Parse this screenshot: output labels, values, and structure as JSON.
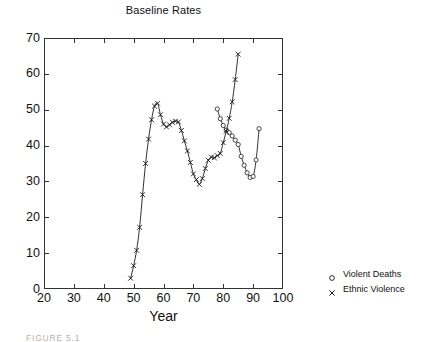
{
  "chart_data": {
    "type": "line",
    "title": "Baseline Rates",
    "xlabel": "Year",
    "ylabel": "",
    "xlim": [
      20,
      100
    ],
    "ylim": [
      0,
      70
    ],
    "xticks": [
      20,
      30,
      40,
      50,
      60,
      70,
      80,
      90,
      100
    ],
    "yticks": [
      0,
      10,
      20,
      30,
      40,
      50,
      60,
      70
    ],
    "grid": false,
    "legend_position": "right-outside",
    "series": [
      {
        "name": "Violent Deaths",
        "marker": "circle",
        "x": [
          78,
          79,
          80,
          81,
          82,
          83,
          84,
          85,
          86,
          87,
          88,
          89,
          90,
          91,
          92
        ],
        "y": [
          50.2,
          47.5,
          45.6,
          44.3,
          43.6,
          42.7,
          41.5,
          40.3,
          37.0,
          34.5,
          32.4,
          31.1,
          31.4,
          36.0,
          44.7
        ]
      },
      {
        "name": "Ethnic Violence",
        "marker": "cross",
        "x": [
          49,
          50,
          51,
          52,
          53,
          54,
          55,
          56,
          57,
          58,
          59,
          60,
          61,
          62,
          63,
          64,
          65,
          66,
          67,
          68,
          69,
          70,
          71,
          72,
          73,
          74,
          75,
          76,
          77,
          78,
          79,
          80,
          81,
          82,
          83,
          84,
          85
        ],
        "y": [
          3.0,
          6.5,
          10.8,
          17.2,
          26.3,
          35.0,
          41.8,
          47.2,
          51.0,
          51.8,
          48.6,
          46.0,
          45.2,
          45.8,
          46.5,
          46.8,
          46.6,
          44.2,
          41.3,
          38.5,
          35.3,
          32.1,
          30.5,
          29.2,
          30.8,
          33.6,
          35.9,
          36.8,
          36.6,
          37.2,
          37.8,
          40.8,
          44.0,
          47.6,
          52.2,
          58.4,
          65.5
        ]
      }
    ]
  },
  "legend": {
    "items": [
      {
        "label": "Violent Deaths",
        "marker": "circle"
      },
      {
        "label": "Ethnic Violence",
        "marker": "cross"
      }
    ]
  },
  "caption": {
    "text": "FIGURE 5.1"
  },
  "colors": {
    "line": "#1a1a1a",
    "axis": "#333333",
    "text": "#111111",
    "caption": "#b9b2a8",
    "background": "#ffffff"
  }
}
